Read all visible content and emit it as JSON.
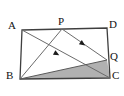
{
  "figure": {
    "type": "geometry-diagram",
    "shape": "parallelogram",
    "background_color": "#ffffff",
    "stroke_color": "#4d4d4d",
    "outline_color": "#3c3c3c",
    "shade_color": "#a8a8a8",
    "label_color": "#111111",
    "vertices": [
      {
        "id": "A",
        "label": "A",
        "x": 22,
        "y": 30,
        "label_x": 8,
        "label_y": 20
      },
      {
        "id": "D",
        "label": "D",
        "x": 107,
        "y": 28,
        "label_x": 109,
        "label_y": 19
      },
      {
        "id": "B",
        "label": "B",
        "x": 20,
        "y": 79,
        "label_x": 6,
        "label_y": 70
      },
      {
        "id": "C",
        "label": "C",
        "x": 110,
        "y": 78,
        "label_x": 112,
        "label_y": 70
      },
      {
        "id": "P",
        "label": "P",
        "x": 62,
        "y": 29,
        "label_x": 58,
        "label_y": 17
      },
      {
        "id": "Q",
        "label": "Q",
        "x": 107,
        "y": 60,
        "label_x": 110,
        "label_y": 51
      }
    ],
    "outline_points": "22,30 107,28 110,78 20,79",
    "shaded_region": {
      "name": "triangle-BQC",
      "points": "20,79 107,60 110,78",
      "fill": "#a8a8a8",
      "opacity": 0.85
    },
    "segments": [
      {
        "name": "side-AD",
        "x1": 22,
        "y1": 30,
        "x2": 107,
        "y2": 28
      },
      {
        "name": "side-DC",
        "x1": 107,
        "y1": 28,
        "x2": 110,
        "y2": 78
      },
      {
        "name": "side-BC",
        "x1": 20,
        "y1": 79,
        "x2": 110,
        "y2": 78
      },
      {
        "name": "side-AB",
        "x1": 22,
        "y1": 30,
        "x2": 20,
        "y2": 79
      },
      {
        "name": "diagonal-AC",
        "x1": 22,
        "y1": 30,
        "x2": 110,
        "y2": 78
      },
      {
        "name": "cevian-PB",
        "x1": 62,
        "y1": 29,
        "x2": 20,
        "y2": 79
      },
      {
        "name": "cevian-PQ",
        "x1": 62,
        "y1": 29,
        "x2": 107,
        "y2": 60
      },
      {
        "name": "segment-BQ",
        "x1": 20,
        "y1": 79,
        "x2": 107,
        "y2": 60
      }
    ],
    "tick_markers": [
      {
        "name": "arrow-marker-on-AC",
        "x": 57,
        "y": 54,
        "angle": 28.6
      },
      {
        "name": "arrow-marker-on-PQ",
        "x": 83,
        "y": 44,
        "angle": 34.5
      }
    ]
  }
}
